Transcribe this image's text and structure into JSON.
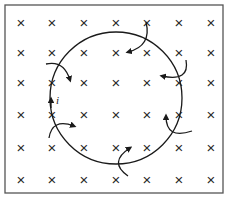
{
  "diagram": {
    "title": "",
    "field_symbol": "×",
    "field_direction": "into the page",
    "grid": {
      "columns": [
        21,
        52,
        84,
        116,
        147,
        179,
        211
      ],
      "rows": [
        23,
        53,
        83,
        115,
        148,
        180
      ]
    },
    "loop": {
      "cx": 116,
      "cy": 98,
      "r": 66
    },
    "current_label": "i",
    "colors": {
      "line": "#1a1a1a",
      "frame": "#555555",
      "background": "#ffffff"
    }
  }
}
